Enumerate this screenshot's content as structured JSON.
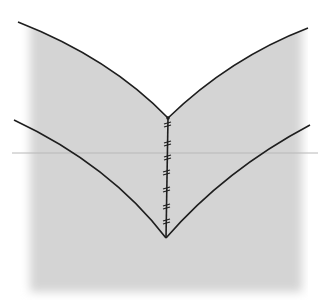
{
  "diagram": {
    "type": "sewing-seam-illustration",
    "colors": {
      "background": "#ffffff",
      "fabric": "#d4d4d4",
      "outline": "#1e1e1e",
      "fold_line": "#b8b8b8"
    },
    "stitch_count": 7,
    "labels": []
  }
}
